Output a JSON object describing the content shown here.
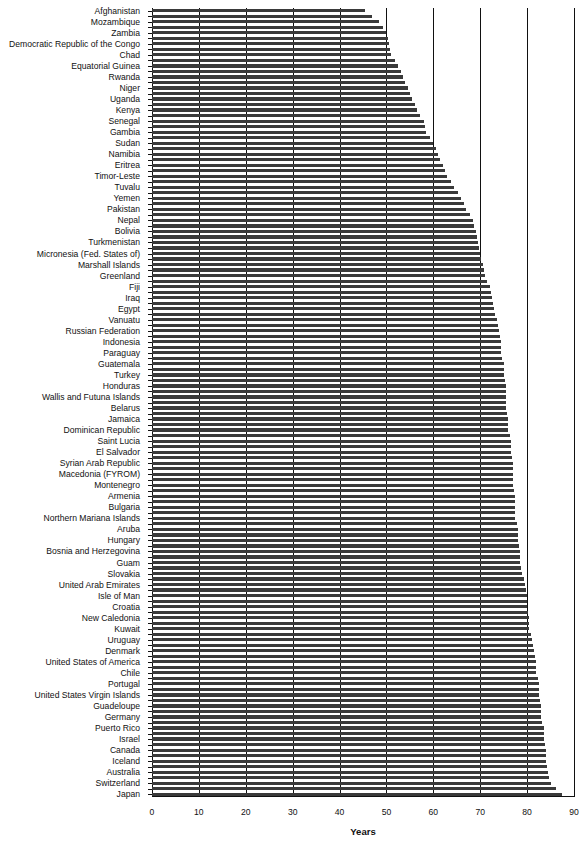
{
  "chart_data": {
    "type": "bar",
    "orientation": "horizontal",
    "title": "",
    "xlabel": "Years",
    "ylabel": "",
    "xlim": [
      0,
      90
    ],
    "xticks": [
      0,
      10,
      20,
      30,
      40,
      50,
      60,
      70,
      80,
      90
    ],
    "grid": "vertical lines at 10-year intervals",
    "legend": null,
    "labeled_categories": [
      "Afghanistan",
      "Mozambique",
      "Zambia",
      "Democratic Republic of the Congo",
      "Chad",
      "Equatorial Guinea",
      "Rwanda",
      "Niger",
      "Uganda",
      "Kenya",
      "Senegal",
      "Gambia",
      "Sudan",
      "Namibia",
      "Eritrea",
      "Timor-Leste",
      "Tuvalu",
      "Yemen",
      "Pakistan",
      "Nepal",
      "Bolivia",
      "Turkmenistan",
      "Micronesia (Fed. States of)",
      "Marshall Islands",
      "Greenland",
      "Fiji",
      "Iraq",
      "Egypt",
      "Vanuatu",
      "Russian Federation",
      "Indonesia",
      "Paraguay",
      "Guatemala",
      "Turkey",
      "Honduras",
      "Wallis and Futuna Islands",
      "Belarus",
      "Jamaica",
      "Dominican Republic",
      "Saint Lucia",
      "El Salvador",
      "Syrian Arab Republic",
      "Macedonia (FYROM)",
      "Montenegro",
      "Armenia",
      "Bulgaria",
      "Northern Mariana Islands",
      "Aruba",
      "Hungary",
      "Bosnia and Herzegovina",
      "Guam",
      "Slovakia",
      "United Arab Emirates",
      "Isle of Man",
      "Croatia",
      "New Caledonia",
      "Kuwait",
      "Uruguay",
      "Denmark",
      "United States of America",
      "Chile",
      "Portugal",
      "United States Virgin Islands",
      "Guadeloupe",
      "Germany",
      "Puerto Rico",
      "Israel",
      "Canada",
      "Iceland",
      "Australia",
      "Switzerland",
      "Japan"
    ],
    "values_labeled": [
      45.5,
      48.5,
      50.0,
      50.5,
      51.0,
      52.5,
      53.5,
      54.5,
      55.5,
      56.5,
      58.0,
      58.5,
      60.0,
      61.0,
      62.0,
      63.0,
      64.5,
      66.0,
      67.0,
      68.5,
      69.0,
      69.5,
      70.0,
      70.5,
      71.0,
      72.0,
      72.5,
      73.0,
      73.5,
      74.0,
      74.5,
      74.5,
      75.0,
      75.0,
      75.5,
      75.5,
      75.5,
      76.0,
      76.0,
      76.5,
      76.5,
      77.0,
      77.0,
      77.0,
      77.5,
      77.5,
      77.5,
      78.0,
      78.0,
      78.5,
      78.5,
      79.0,
      79.5,
      80.0,
      80.0,
      80.5,
      80.5,
      81.0,
      81.5,
      82.0,
      82.0,
      82.5,
      82.5,
      83.0,
      83.0,
      83.5,
      83.5,
      84.0,
      84.0,
      84.5,
      85.0,
      87.4
    ],
    "note": "Each labeled country is followed by one unlabeled bar; unlabeled bars take the midpoint between neighbours."
  }
}
